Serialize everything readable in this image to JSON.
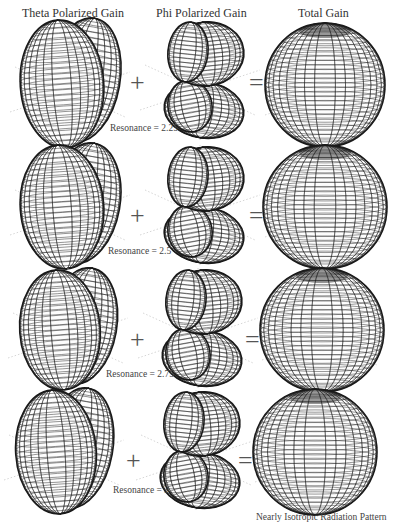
{
  "headers": {
    "theta": "Theta Polarized Gain",
    "phi": "Phi Polarized Gain",
    "total": "Total Gain"
  },
  "operators": {
    "plus": "+",
    "equals": "="
  },
  "rows": [
    {
      "resonance_label": "Resonance = 2.25",
      "resonance": 2.25
    },
    {
      "resonance_label": "Resonance = 2.5",
      "resonance": 2.5
    },
    {
      "resonance_label": "Resonance = 2.75",
      "resonance": 2.75
    },
    {
      "resonance_label": "Resonance = 3",
      "resonance": 3
    }
  ],
  "footer": "Nearly Isotropic Radiation Pattern",
  "colors": {
    "mesh": "#1a1a1a",
    "background": "#ffffff",
    "axes": "#bbbbbb"
  }
}
